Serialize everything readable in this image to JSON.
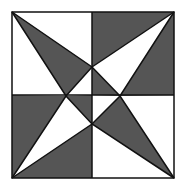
{
  "diagram": {
    "colors": {
      "background": "#ffffff",
      "dark": "#555555",
      "stroke": "#111111"
    },
    "square": {
      "x1": 12,
      "y1": 12,
      "x2": 174,
      "y2": 178
    },
    "center": {
      "x": 92,
      "y": 95
    },
    "inner_points": {
      "top": [
        92,
        67
      ],
      "left": [
        66,
        96
      ],
      "right": [
        120,
        96
      ],
      "bottom": [
        92,
        124
      ]
    }
  }
}
